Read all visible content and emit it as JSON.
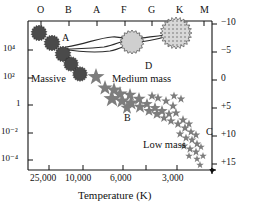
{
  "figure": {
    "name": "hertzsprung-russell-diagram",
    "background": "#ffffff",
    "ink": "#111111"
  },
  "axes": {
    "top": {
      "name": "spectral-class-axis",
      "title": "",
      "ticks": [
        "O",
        "B",
        "A",
        "F",
        "G",
        "K",
        "M"
      ]
    },
    "bottom": {
      "name": "temperature-axis",
      "title": "Temperature (K)",
      "ticks": [
        "25,000",
        "10,000",
        "6,000",
        "3,000"
      ]
    },
    "left": {
      "name": "luminosity-axis",
      "title": "",
      "ticks": [
        "10⁴",
        "10²",
        "1",
        "10⁻²",
        "10⁻⁴"
      ]
    },
    "right": {
      "name": "absolute-magnitude-axis",
      "title": "",
      "ticks": [
        "−10",
        "−5",
        "0",
        "+5",
        "+10",
        "+15"
      ]
    }
  },
  "annotations": [
    {
      "id": "A",
      "text": "A",
      "x": 62,
      "y": 33
    },
    {
      "id": "D",
      "text": "D",
      "x": 145,
      "y": 61
    },
    {
      "id": "B",
      "text": "B",
      "x": 124,
      "y": 113
    },
    {
      "id": "C",
      "text": "C",
      "x": 206,
      "y": 127
    },
    {
      "id": "massive",
      "text": "Massive",
      "x": 31,
      "y": 74
    },
    {
      "id": "medium-mass",
      "text": "Medium mass",
      "x": 112,
      "y": 74
    },
    {
      "id": "low-mass",
      "text": "Low mass",
      "x": 143,
      "y": 140
    }
  ],
  "colors": {
    "massive_star": "#4a4a4a",
    "medium_star": "#b5b5b5",
    "giant_star": "#cfcfcf",
    "supergiant_star": "#b9b9b9",
    "main_sequence_star": "#7d7d7d",
    "track_line": "#2b2b2b"
  },
  "chart_data": {
    "type": "scatter",
    "xlabel": "Temperature (K)",
    "ylabel": "Luminosity (solar units)",
    "y2label": "Absolute magnitude",
    "grid": false,
    "legend": null,
    "xaxis_top_ticklabels": [
      "O",
      "B",
      "A",
      "F",
      "G",
      "K",
      "M"
    ],
    "xaxis_bottom_ticklabels": [
      "25,000",
      "10,000",
      "6,000",
      "3,000"
    ],
    "yaxis_left_ticklabels": [
      "10⁴",
      "10²",
      "1",
      "10⁻²",
      "10⁻⁴"
    ],
    "yaxis_right_ticklabels": [
      "−10",
      "−5",
      "0",
      "+5",
      "+10",
      "+15"
    ],
    "xaxis_inverted": true,
    "yaxis_left_log": true,
    "series": [
      {
        "name": "Massive stars (upper main sequence)",
        "marker": "spiky-disk",
        "color": "#4a4a4a",
        "points": [
          {
            "x": 39,
            "y": 33,
            "r": 8
          },
          {
            "x": 52,
            "y": 43,
            "r": 8
          },
          {
            "x": 63,
            "y": 54,
            "r": 8
          },
          {
            "x": 71,
            "y": 64,
            "r": 7.5
          },
          {
            "x": 80,
            "y": 74,
            "r": 7.5
          }
        ]
      },
      {
        "name": "Giant star D",
        "marker": "spiky-disk",
        "color": "#cfcfcf",
        "points": [
          {
            "x": 132,
            "y": 42,
            "r": 12
          }
        ]
      },
      {
        "name": "Supergiant star",
        "marker": "hatched-disk",
        "color": "#b9b9b9",
        "points": [
          {
            "x": 176,
            "y": 33,
            "r": 16
          }
        ]
      },
      {
        "name": "Main sequence stars",
        "marker": "star",
        "color": "#7d7d7d",
        "points": [
          {
            "x": 96,
            "y": 77,
            "s": 9
          },
          {
            "x": 105,
            "y": 88,
            "s": 8
          },
          {
            "x": 114,
            "y": 90,
            "s": 8
          },
          {
            "x": 120,
            "y": 94,
            "s": 8
          },
          {
            "x": 112,
            "y": 99,
            "s": 9
          },
          {
            "x": 122,
            "y": 101,
            "s": 8
          },
          {
            "x": 130,
            "y": 95,
            "s": 7
          },
          {
            "x": 131,
            "y": 103,
            "s": 8
          },
          {
            "x": 139,
            "y": 99,
            "s": 7
          },
          {
            "x": 140,
            "y": 107,
            "s": 7
          },
          {
            "x": 127,
            "y": 108,
            "s": 7
          },
          {
            "x": 147,
            "y": 104,
            "s": 6
          },
          {
            "x": 149,
            "y": 111,
            "s": 6
          },
          {
            "x": 155,
            "y": 108,
            "s": 6
          },
          {
            "x": 157,
            "y": 114,
            "s": 6
          },
          {
            "x": 162,
            "y": 111,
            "s": 6
          },
          {
            "x": 164,
            "y": 118,
            "s": 5
          },
          {
            "x": 169,
            "y": 114,
            "s": 5
          },
          {
            "x": 171,
            "y": 121,
            "s": 5
          },
          {
            "x": 158,
            "y": 98,
            "s": 5
          },
          {
            "x": 166,
            "y": 101,
            "s": 5
          },
          {
            "x": 173,
            "y": 106,
            "s": 5
          },
          {
            "x": 176,
            "y": 113,
            "s": 5
          },
          {
            "x": 178,
            "y": 124,
            "s": 5
          },
          {
            "x": 183,
            "y": 120,
            "s": 5
          },
          {
            "x": 185,
            "y": 128,
            "s": 5
          },
          {
            "x": 189,
            "y": 124,
            "s": 4.5
          },
          {
            "x": 191,
            "y": 132,
            "s": 4.5
          },
          {
            "x": 180,
            "y": 134,
            "s": 4.5
          },
          {
            "x": 186,
            "y": 138,
            "s": 4.5
          },
          {
            "x": 192,
            "y": 140,
            "s": 4.5
          },
          {
            "x": 196,
            "y": 135,
            "s": 4.5
          },
          {
            "x": 197,
            "y": 144,
            "s": 4.5
          },
          {
            "x": 184,
            "y": 146,
            "s": 4.5
          },
          {
            "x": 190,
            "y": 149,
            "s": 4.5
          },
          {
            "x": 196,
            "y": 152,
            "s": 4.5
          },
          {
            "x": 201,
            "y": 147,
            "s": 4
          },
          {
            "x": 189,
            "y": 156,
            "s": 4
          },
          {
            "x": 197,
            "y": 159,
            "s": 4
          },
          {
            "x": 203,
            "y": 156,
            "s": 4
          },
          {
            "x": 200,
            "y": 165,
            "s": 4
          },
          {
            "x": 174,
            "y": 96,
            "s": 4.5
          },
          {
            "x": 181,
            "y": 99,
            "s": 4.5
          },
          {
            "x": 152,
            "y": 96,
            "s": 5
          }
        ]
      },
      {
        "name": "Evolutionary track",
        "marker": "line",
        "color": "#2b2b2b",
        "description": "Loop from upper main sequence through giant D to supergiant"
      }
    ]
  }
}
